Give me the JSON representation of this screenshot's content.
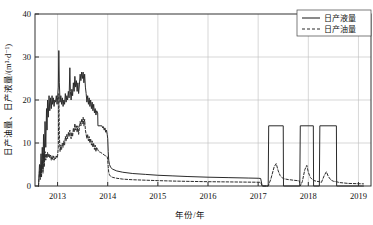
{
  "chart_data": {
    "type": "line",
    "title": "",
    "xlabel": "年份/年",
    "ylabel": "日产油量、日产液量/(m³·d⁻¹)",
    "xlim": [
      2012.55,
      2019.25
    ],
    "ylim": [
      0,
      40
    ],
    "grid": true,
    "xticks": [
      2013,
      2014,
      2015,
      2016,
      2017,
      2018,
      2019
    ],
    "xtick_labels": [
      "2013",
      "2014",
      "2015",
      "2016",
      "2017",
      "2018",
      "2019"
    ],
    "yticks": [
      0,
      10,
      20,
      30,
      40
    ],
    "ytick_labels": [
      "0",
      "10",
      "20",
      "30",
      "40"
    ],
    "legend_position": "top-right",
    "series": [
      {
        "name": "日产液量",
        "style": "solid",
        "color": "#2b2b2b",
        "points": [
          [
            2012.62,
            0.0
          ],
          [
            2012.64,
            5.0
          ],
          [
            2012.655,
            2.0
          ],
          [
            2012.67,
            7.5
          ],
          [
            2012.68,
            3.0
          ],
          [
            2012.695,
            9.0
          ],
          [
            2012.71,
            4.0
          ],
          [
            2012.72,
            12.0
          ],
          [
            2012.735,
            6.0
          ],
          [
            2012.75,
            15.0
          ],
          [
            2012.765,
            9.0
          ],
          [
            2012.78,
            18.0
          ],
          [
            2012.79,
            13.0
          ],
          [
            2012.8,
            20.0
          ],
          [
            2012.815,
            16.0
          ],
          [
            2012.83,
            21.0
          ],
          [
            2012.845,
            17.5
          ],
          [
            2012.86,
            20.5
          ],
          [
            2012.875,
            18.0
          ],
          [
            2012.89,
            21.0
          ],
          [
            2012.9,
            19.0
          ],
          [
            2012.915,
            20.5
          ],
          [
            2012.93,
            18.5
          ],
          [
            2012.945,
            20.0
          ],
          [
            2012.96,
            19.5
          ],
          [
            2012.975,
            21.0
          ],
          [
            2012.99,
            19.0
          ],
          [
            2013.0,
            20.5
          ],
          [
            2013.015,
            23.0
          ],
          [
            2013.025,
            31.5
          ],
          [
            2013.035,
            24.0
          ],
          [
            2013.05,
            19.5
          ],
          [
            2013.065,
            21.0
          ],
          [
            2013.08,
            19.0
          ],
          [
            2013.095,
            20.5
          ],
          [
            2013.11,
            18.5
          ],
          [
            2013.125,
            20.0
          ],
          [
            2013.14,
            19.0
          ],
          [
            2013.155,
            21.5
          ],
          [
            2013.17,
            19.5
          ],
          [
            2013.185,
            21.0
          ],
          [
            2013.2,
            20.0
          ],
          [
            2013.215,
            22.0
          ],
          [
            2013.23,
            20.5
          ],
          [
            2013.245,
            27.5
          ],
          [
            2013.255,
            22.0
          ],
          [
            2013.27,
            20.0
          ],
          [
            2013.285,
            22.5
          ],
          [
            2013.3,
            21.0
          ],
          [
            2013.315,
            24.0
          ],
          [
            2013.33,
            22.0
          ],
          [
            2013.345,
            25.5
          ],
          [
            2013.36,
            23.0
          ],
          [
            2013.375,
            24.5
          ],
          [
            2013.39,
            22.0
          ],
          [
            2013.405,
            24.0
          ],
          [
            2013.42,
            21.5
          ],
          [
            2013.435,
            23.5
          ],
          [
            2013.45,
            26.0
          ],
          [
            2013.465,
            24.5
          ],
          [
            2013.48,
            26.5
          ],
          [
            2013.495,
            25.0
          ],
          [
            2013.51,
            26.5
          ],
          [
            2013.525,
            24.0
          ],
          [
            2013.54,
            26.0
          ],
          [
            2013.555,
            23.0
          ],
          [
            2013.57,
            21.5
          ],
          [
            2013.585,
            19.5
          ],
          [
            2013.6,
            21.0
          ],
          [
            2013.615,
            19.0
          ],
          [
            2013.63,
            20.5
          ],
          [
            2013.645,
            18.5
          ],
          [
            2013.66,
            20.0
          ],
          [
            2013.675,
            18.0
          ],
          [
            2013.69,
            19.5
          ],
          [
            2013.705,
            17.5
          ],
          [
            2013.72,
            19.0
          ],
          [
            2013.735,
            17.0
          ],
          [
            2013.75,
            18.0
          ],
          [
            2013.765,
            16.5
          ],
          [
            2013.78,
            17.5
          ],
          [
            2013.8,
            17.0
          ],
          [
            2013.805,
            14.0
          ],
          [
            2013.88,
            14.0
          ],
          [
            2013.885,
            14.0
          ],
          [
            2013.9,
            13.5
          ],
          [
            2013.915,
            13.8
          ],
          [
            2013.93,
            13.0
          ],
          [
            2013.945,
            13.5
          ],
          [
            2013.96,
            12.5
          ],
          [
            2013.975,
            13.0
          ],
          [
            2013.99,
            12.0
          ],
          [
            2014.0,
            11.0
          ],
          [
            2014.01,
            8.0
          ],
          [
            2014.02,
            6.0
          ],
          [
            2014.035,
            5.0
          ],
          [
            2014.06,
            4.3
          ],
          [
            2014.1,
            3.9
          ],
          [
            2014.18,
            3.5
          ],
          [
            2014.3,
            3.2
          ],
          [
            2014.5,
            2.9
          ],
          [
            2014.75,
            2.7
          ],
          [
            2015.0,
            2.5
          ],
          [
            2015.3,
            2.35
          ],
          [
            2015.6,
            2.2
          ],
          [
            2016.0,
            2.05
          ],
          [
            2016.4,
            1.95
          ],
          [
            2016.8,
            1.85
          ],
          [
            2017.0,
            1.8
          ],
          [
            2017.05,
            1.75
          ],
          [
            2017.08,
            0.0
          ],
          [
            2017.2,
            0.0
          ],
          [
            2017.21,
            14.0
          ],
          [
            2017.5,
            14.0
          ],
          [
            2017.505,
            0.0
          ],
          [
            2017.83,
            0.0
          ],
          [
            2017.84,
            14.0
          ],
          [
            2018.1,
            14.0
          ],
          [
            2018.105,
            0.0
          ],
          [
            2018.22,
            0.0
          ],
          [
            2018.23,
            14.0
          ],
          [
            2018.56,
            14.0
          ],
          [
            2018.565,
            0.0
          ],
          [
            2019.1,
            0.0
          ]
        ]
      },
      {
        "name": "日产油量",
        "style": "dashed",
        "color": "#2b2b2b",
        "points": [
          [
            2012.62,
            0.0
          ],
          [
            2012.64,
            3.5
          ],
          [
            2012.655,
            1.5
          ],
          [
            2012.67,
            5.0
          ],
          [
            2012.68,
            2.0
          ],
          [
            2012.695,
            6.0
          ],
          [
            2012.71,
            3.0
          ],
          [
            2012.72,
            7.5
          ],
          [
            2012.735,
            4.5
          ],
          [
            2012.75,
            8.0
          ],
          [
            2012.765,
            6.0
          ],
          [
            2012.78,
            7.5
          ],
          [
            2012.79,
            6.5
          ],
          [
            2012.8,
            7.8
          ],
          [
            2012.815,
            6.8
          ],
          [
            2012.83,
            7.5
          ],
          [
            2012.845,
            6.5
          ],
          [
            2012.86,
            7.2
          ],
          [
            2012.875,
            6.0
          ],
          [
            2012.89,
            7.0
          ],
          [
            2012.9,
            6.2
          ],
          [
            2012.915,
            7.0
          ],
          [
            2012.93,
            6.0
          ],
          [
            2012.945,
            6.8
          ],
          [
            2012.96,
            6.3
          ],
          [
            2012.975,
            7.0
          ],
          [
            2012.99,
            6.5
          ],
          [
            2013.0,
            7.0
          ],
          [
            2013.015,
            9.0
          ],
          [
            2013.025,
            21.5
          ],
          [
            2013.035,
            12.0
          ],
          [
            2013.05,
            8.0
          ],
          [
            2013.065,
            9.5
          ],
          [
            2013.08,
            8.5
          ],
          [
            2013.095,
            10.0
          ],
          [
            2013.11,
            9.0
          ],
          [
            2013.125,
            10.5
          ],
          [
            2013.14,
            9.5
          ],
          [
            2013.155,
            11.5
          ],
          [
            2013.17,
            10.5
          ],
          [
            2013.185,
            12.0
          ],
          [
            2013.2,
            11.0
          ],
          [
            2013.215,
            12.5
          ],
          [
            2013.23,
            11.5
          ],
          [
            2013.245,
            13.0
          ],
          [
            2013.255,
            12.0
          ],
          [
            2013.27,
            11.0
          ],
          [
            2013.285,
            12.5
          ],
          [
            2013.3,
            11.5
          ],
          [
            2013.315,
            13.5
          ],
          [
            2013.33,
            12.5
          ],
          [
            2013.345,
            14.5
          ],
          [
            2013.36,
            13.0
          ],
          [
            2013.375,
            14.0
          ],
          [
            2013.39,
            12.5
          ],
          [
            2013.405,
            14.0
          ],
          [
            2013.42,
            12.0
          ],
          [
            2013.435,
            13.5
          ],
          [
            2013.45,
            15.0
          ],
          [
            2013.465,
            14.0
          ],
          [
            2013.48,
            15.5
          ],
          [
            2013.495,
            14.5
          ],
          [
            2013.51,
            16.0
          ],
          [
            2013.525,
            14.0
          ],
          [
            2013.54,
            15.5
          ],
          [
            2013.555,
            13.0
          ],
          [
            2013.57,
            12.0
          ],
          [
            2013.585,
            11.0
          ],
          [
            2013.6,
            12.0
          ],
          [
            2013.615,
            10.5
          ],
          [
            2013.63,
            11.5
          ],
          [
            2013.645,
            10.0
          ],
          [
            2013.66,
            11.0
          ],
          [
            2013.675,
            9.5
          ],
          [
            2013.69,
            10.5
          ],
          [
            2013.705,
            9.0
          ],
          [
            2013.72,
            10.0
          ],
          [
            2013.735,
            8.5
          ],
          [
            2013.75,
            9.5
          ],
          [
            2013.765,
            8.0
          ],
          [
            2013.78,
            9.0
          ],
          [
            2013.8,
            8.5
          ],
          [
            2013.82,
            8.0
          ],
          [
            2013.86,
            7.8
          ],
          [
            2013.9,
            7.5
          ],
          [
            2013.93,
            7.2
          ],
          [
            2013.96,
            7.0
          ],
          [
            2013.99,
            6.8
          ],
          [
            2014.0,
            6.0
          ],
          [
            2014.01,
            4.5
          ],
          [
            2014.02,
            3.2
          ],
          [
            2014.035,
            2.6
          ],
          [
            2014.06,
            2.2
          ],
          [
            2014.1,
            2.0
          ],
          [
            2014.18,
            1.8
          ],
          [
            2014.3,
            1.6
          ],
          [
            2014.5,
            1.45
          ],
          [
            2014.75,
            1.35
          ],
          [
            2015.0,
            1.25
          ],
          [
            2015.3,
            1.15
          ],
          [
            2015.6,
            1.08
          ],
          [
            2016.0,
            1.0
          ],
          [
            2016.4,
            0.95
          ],
          [
            2016.8,
            0.9
          ],
          [
            2017.0,
            0.88
          ],
          [
            2017.05,
            0.85
          ],
          [
            2017.08,
            0.0
          ],
          [
            2017.2,
            0.0
          ],
          [
            2017.25,
            1.5
          ],
          [
            2017.32,
            4.5
          ],
          [
            2017.36,
            5.2
          ],
          [
            2017.4,
            3.5
          ],
          [
            2017.44,
            2.4
          ],
          [
            2017.48,
            1.9
          ],
          [
            2017.505,
            1.7
          ],
          [
            2017.6,
            1.5
          ],
          [
            2017.7,
            1.35
          ],
          [
            2017.82,
            1.2
          ],
          [
            2017.84,
            0.0
          ],
          [
            2017.88,
            1.0
          ],
          [
            2017.93,
            3.8
          ],
          [
            2017.97,
            4.8
          ],
          [
            2018.0,
            3.2
          ],
          [
            2018.04,
            2.0
          ],
          [
            2018.08,
            1.5
          ],
          [
            2018.105,
            1.3
          ],
          [
            2018.16,
            1.1
          ],
          [
            2018.22,
            1.0
          ],
          [
            2018.26,
            0.8
          ],
          [
            2018.32,
            2.5
          ],
          [
            2018.36,
            3.3
          ],
          [
            2018.4,
            2.2
          ],
          [
            2018.45,
            1.4
          ],
          [
            2018.5,
            1.1
          ],
          [
            2018.56,
            1.0
          ],
          [
            2018.62,
            0.8
          ],
          [
            2018.8,
            0.6
          ],
          [
            2019.1,
            0.5
          ]
        ]
      }
    ]
  },
  "legend": {
    "entries": [
      {
        "label": "日产液量",
        "style": "solid"
      },
      {
        "label": "日产油量",
        "style": "dashed"
      }
    ]
  }
}
